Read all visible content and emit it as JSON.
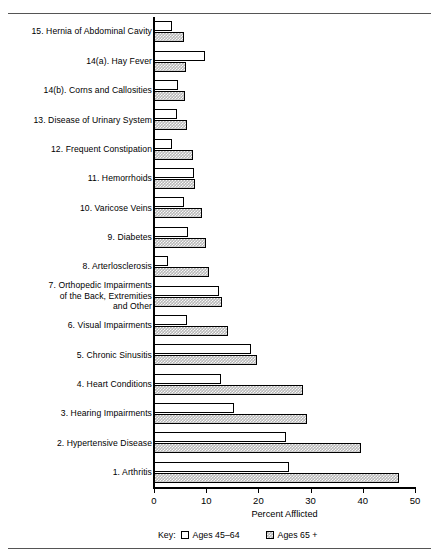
{
  "chart_data": {
    "type": "bar",
    "orientation": "horizontal",
    "title": "",
    "xlabel": "Percent Afflicted",
    "ylabel": "",
    "xlim": [
      0,
      50
    ],
    "xticks": [
      0,
      10,
      20,
      30,
      40,
      50
    ],
    "xtick_labels": [
      "0",
      "10",
      "20",
      "30",
      "40",
      "50"
    ],
    "grid": false,
    "legend_position": "bottom-left",
    "legend_prefix": "Key:",
    "categories": [
      "15. Hernia of Abdominal Cavity",
      "14(a). Hay Fever",
      "14(b). Corns and Callosities",
      "13. Disease of Urinary System",
      "12. Frequent Constipation",
      "11. Hemorrhoids",
      "10. Varicose Veins",
      "9. Diabetes",
      "8. Arterlosclerosis",
      "7. Orthopedic Impairments\nof the Back, Extremities\nand Other",
      "6. Visual Impairments",
      "5. Chronic Sinusitis",
      "4. Heart Conditions",
      "3. Hearing Impairments",
      "2. Hypertensive Disease",
      "1. Arthritis"
    ],
    "series": [
      {
        "name": "Ages 45-64",
        "pattern": "white",
        "values": [
          3.4,
          9.7,
          4.6,
          4.4,
          3.4,
          7.7,
          5.7,
          6.5,
          2.6,
          12.4,
          6.3,
          18.5,
          12.9,
          15.4,
          25.2,
          25.9
        ]
      },
      {
        "name": "Ages 65 +",
        "pattern": "shaded",
        "values": [
          5.8,
          6.2,
          6.0,
          6.4,
          7.4,
          7.8,
          9.2,
          10.0,
          10.6,
          13.1,
          14.2,
          19.8,
          28.6,
          29.4,
          39.7,
          47.0
        ]
      }
    ]
  },
  "axis": {
    "x_label": "Percent Afflicted",
    "tick_labels": [
      "0",
      "10",
      "20",
      "30",
      "40",
      "50"
    ]
  },
  "legend": {
    "key_word": "Key:",
    "entries": [
      {
        "label": "Ages 45–64",
        "swatch": "white"
      },
      {
        "label": "Ages 65 +",
        "swatch": "shaded"
      }
    ]
  },
  "colors": {
    "axis": "#000000",
    "bar_outline": "#000000",
    "bar_young_fill": "#ffffff",
    "bar_old_fill": "#b8b8b8",
    "rule": "#555555",
    "background": "#ffffff"
  }
}
